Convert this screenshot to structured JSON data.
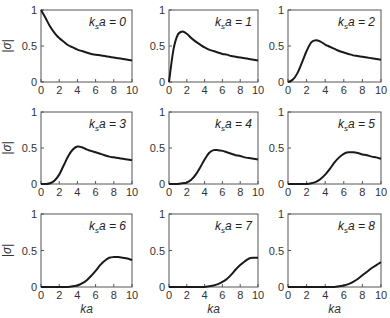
{
  "chart_data": {
    "type": "line",
    "layout": "3x3 small multiples",
    "xlabel": "ka",
    "ylabel": "|σ|",
    "xlim": [
      0,
      10
    ],
    "ylim": [
      0,
      1
    ],
    "xticks": [
      "0",
      "2",
      "4",
      "6",
      "8",
      "10"
    ],
    "yticks": [
      "0",
      "0.5",
      "1"
    ],
    "grid": false,
    "x": [
      0,
      0.5,
      1,
      1.5,
      2,
      2.5,
      3,
      3.5,
      4,
      4.5,
      5,
      5.5,
      6,
      6.5,
      7,
      7.5,
      8,
      8.5,
      9,
      9.5,
      10
    ],
    "series": [
      {
        "name": "k_s a = 0",
        "label_main": "k",
        "label_sub": "s",
        "label_rest": "a = 0",
        "values": [
          1.0,
          0.89,
          0.77,
          0.68,
          0.61,
          0.56,
          0.51,
          0.48,
          0.45,
          0.43,
          0.41,
          0.39,
          0.38,
          0.37,
          0.36,
          0.35,
          0.34,
          0.33,
          0.32,
          0.31,
          0.3
        ]
      },
      {
        "name": "k_s a = 1",
        "label_main": "k",
        "label_sub": "s",
        "label_rest": "a = 1",
        "values": [
          0.0,
          0.45,
          0.66,
          0.7,
          0.67,
          0.61,
          0.56,
          0.52,
          0.48,
          0.45,
          0.43,
          0.41,
          0.39,
          0.38,
          0.36,
          0.35,
          0.34,
          0.33,
          0.32,
          0.31,
          0.3
        ]
      },
      {
        "name": "k_s a = 2",
        "label_main": "k",
        "label_sub": "s",
        "label_rest": "a = 2",
        "values": [
          0.0,
          0.03,
          0.12,
          0.27,
          0.43,
          0.55,
          0.58,
          0.56,
          0.52,
          0.49,
          0.46,
          0.43,
          0.41,
          0.39,
          0.37,
          0.36,
          0.35,
          0.34,
          0.33,
          0.32,
          0.31
        ]
      },
      {
        "name": "k_s a = 3",
        "label_main": "k",
        "label_sub": "s",
        "label_rest": "a = 3",
        "values": [
          0.0,
          0.0,
          0.01,
          0.05,
          0.13,
          0.26,
          0.39,
          0.48,
          0.52,
          0.51,
          0.48,
          0.46,
          0.44,
          0.42,
          0.4,
          0.38,
          0.37,
          0.36,
          0.35,
          0.34,
          0.33
        ]
      },
      {
        "name": "k_s a = 4",
        "label_main": "k",
        "label_sub": "s",
        "label_rest": "a = 4",
        "values": [
          0.0,
          0.0,
          0.0,
          0.01,
          0.02,
          0.06,
          0.13,
          0.23,
          0.34,
          0.43,
          0.47,
          0.47,
          0.46,
          0.44,
          0.42,
          0.4,
          0.39,
          0.37,
          0.36,
          0.35,
          0.34
        ]
      },
      {
        "name": "k_s a = 5",
        "label_main": "k",
        "label_sub": "s",
        "label_rest": "a = 5",
        "values": [
          0.0,
          0.0,
          0.0,
          0.0,
          0.0,
          0.01,
          0.03,
          0.07,
          0.13,
          0.21,
          0.3,
          0.37,
          0.42,
          0.44,
          0.44,
          0.43,
          0.41,
          0.4,
          0.38,
          0.37,
          0.35
        ]
      },
      {
        "name": "k_s a = 6",
        "label_main": "k",
        "label_sub": "s",
        "label_rest": "a = 6",
        "values": [
          0.0,
          0.0,
          0.0,
          0.0,
          0.0,
          0.0,
          0.0,
          0.01,
          0.02,
          0.05,
          0.09,
          0.15,
          0.22,
          0.3,
          0.36,
          0.4,
          0.41,
          0.41,
          0.4,
          0.39,
          0.37
        ]
      },
      {
        "name": "k_s a = 7",
        "label_main": "k",
        "label_sub": "s",
        "label_rest": "a = 7",
        "values": [
          0.0,
          0.0,
          0.0,
          0.0,
          0.0,
          0.0,
          0.0,
          0.0,
          0.0,
          0.01,
          0.02,
          0.04,
          0.07,
          0.11,
          0.17,
          0.24,
          0.3,
          0.35,
          0.39,
          0.4,
          0.4
        ]
      },
      {
        "name": "k_s a = 8",
        "label_main": "k",
        "label_sub": "s",
        "label_rest": "a = 8",
        "values": [
          0.0,
          0.0,
          0.0,
          0.0,
          0.0,
          0.0,
          0.0,
          0.0,
          0.0,
          0.0,
          0.0,
          0.01,
          0.02,
          0.04,
          0.07,
          0.11,
          0.16,
          0.21,
          0.26,
          0.3,
          0.34
        ]
      }
    ]
  },
  "colors": {
    "curve": "#1a1a1a",
    "frame": "#555555",
    "background": "#ffffff"
  }
}
